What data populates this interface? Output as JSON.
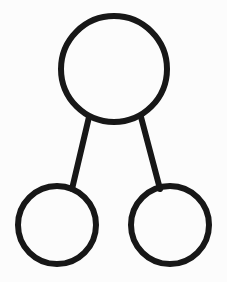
{
  "figure": {
    "background_color": "#fcfcfc",
    "stroke_color": "#171717",
    "width": 227,
    "height": 282
  },
  "chart_data": {
    "type": "diagram",
    "subtype": "node-link-tree",
    "title": "",
    "xlabel": "",
    "ylabel": "",
    "grid": false,
    "legend": null,
    "nodes": [
      {
        "id": "root",
        "label": "",
        "role": "parent",
        "cx": 114,
        "cy": 69,
        "r": 53,
        "stroke_width": 6,
        "stroke": "#171717",
        "fill": "none"
      },
      {
        "id": "child-left",
        "label": "",
        "role": "child",
        "cx": 57,
        "cy": 225,
        "r": 39,
        "stroke_width": 6,
        "stroke": "#171717",
        "fill": "none"
      },
      {
        "id": "child-right",
        "label": "",
        "role": "child",
        "cx": 170,
        "cy": 225,
        "r": 39,
        "stroke_width": 6,
        "stroke": "#171717",
        "fill": "none"
      }
    ],
    "edges": [
      {
        "id": "edge-root-left",
        "from": "root",
        "to": "child-left",
        "x1": 89,
        "y1": 117,
        "x2": 72,
        "y2": 189,
        "stroke_width": 6,
        "stroke": "#171717"
      },
      {
        "id": "edge-root-right",
        "from": "root",
        "to": "child-right",
        "x1": 141,
        "y1": 117,
        "x2": 160,
        "y2": 189,
        "stroke_width": 6,
        "stroke": "#171717"
      }
    ]
  }
}
